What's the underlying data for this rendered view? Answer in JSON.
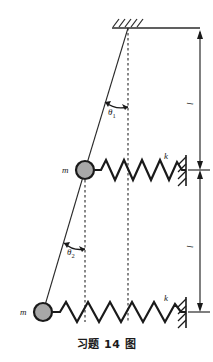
{
  "figure": {
    "caption": "习题 14 图",
    "colors": {
      "stroke": "#2b2b2b",
      "mass_fill": "#a8a8a8",
      "mass_stroke": "#1a1a1a",
      "dashed": "#3a3a3a",
      "background": "#ffffff"
    }
  },
  "labels": {
    "mass_upper": "m",
    "mass_lower": "m",
    "spring_upper": "k",
    "spring_lower": "k",
    "angle_upper": "θ",
    "angle_upper_sub": "1",
    "angle_lower": "θ",
    "angle_lower_sub": "2",
    "length_upper": "l",
    "length_lower": "l"
  },
  "elements": {
    "ceiling": "hatched-ceiling-support",
    "wall_upper": "hatched-wall-right-upper",
    "wall_lower": "hatched-wall-right-lower",
    "rod": "pendulum-rod",
    "dashed_vertical_pivot": "vertical-reference-from-pivot",
    "dashed_vertical_mass": "vertical-reference-from-upper-mass",
    "dimension_upper": "length-dimension-upper",
    "dimension_lower": "length-dimension-lower"
  },
  "geometry": {
    "pivot": {
      "x": 128,
      "y": 28
    },
    "mass_upper": {
      "x": 85,
      "y": 170,
      "r": 9
    },
    "mass_lower": {
      "x": 43,
      "y": 312,
      "r": 9
    },
    "spring_upper": {
      "x1": 95,
      "y1": 170,
      "x2": 186,
      "y2": 170
    },
    "spring_lower": {
      "x1": 53,
      "y1": 312,
      "x2": 186,
      "y2": 312
    },
    "dimension_x": 200,
    "dimension_top_y": 28,
    "dimension_mid_y": 170,
    "dimension_bottom_y": 312
  }
}
